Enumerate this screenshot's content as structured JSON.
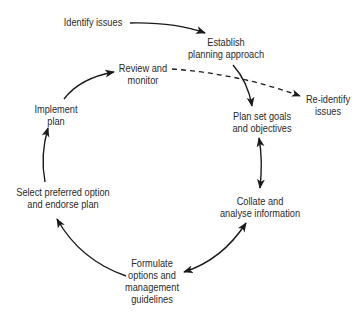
{
  "diagram": {
    "type": "cycle-flow",
    "nodes": {
      "identify_issues": {
        "line1": "Identify issues"
      },
      "establish": {
        "line1": "Establish",
        "line2": "planning approach"
      },
      "review": {
        "line1": "Review and",
        "line2": "monitor"
      },
      "reidentify": {
        "line1": "Re-identify",
        "line2": "issues"
      },
      "implement": {
        "line1": "Implement",
        "line2": "plan"
      },
      "plan_goals": {
        "line1": "Plan set goals",
        "line2": "and objectives"
      },
      "select": {
        "line1": "Select preferred option",
        "line2": "and endorse plan"
      },
      "collate": {
        "line1": "Collate and",
        "line2": "analyse information"
      },
      "formulate": {
        "line1": "Formulate",
        "line2": "options and",
        "line3": "management",
        "line4": "guidelines"
      }
    },
    "edges": [
      {
        "from": "Identify issues",
        "to": "Establish planning approach",
        "style": "solid"
      },
      {
        "from": "Establish planning approach",
        "to": "Plan set goals and objectives",
        "style": "solid"
      },
      {
        "from": "Plan set goals and objectives",
        "to": "Collate and analyse information",
        "style": "solid",
        "bidirectional": true
      },
      {
        "from": "Collate and analyse information",
        "to": "Formulate options and management guidelines",
        "style": "solid",
        "bidirectional": true
      },
      {
        "from": "Formulate options and management guidelines",
        "to": "Select preferred option and endorse plan",
        "style": "solid"
      },
      {
        "from": "Select preferred option and endorse plan",
        "to": "Implement plan",
        "style": "solid"
      },
      {
        "from": "Implement plan",
        "to": "Review and monitor",
        "style": "solid"
      },
      {
        "from": "Review and monitor",
        "to": "Re-identify issues",
        "style": "dashed"
      }
    ],
    "colors": {
      "stroke": "#1a1a1a",
      "text": "#2a2a2a",
      "background": "#ffffff"
    }
  }
}
